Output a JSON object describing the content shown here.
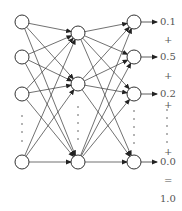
{
  "diagram": {
    "type": "neural-network",
    "layers": [
      {
        "name": "input",
        "x": 22,
        "nodes_y": [
          22,
          57,
          94,
          162
        ],
        "ellipsis_y": [
          116,
          124,
          132,
          141
        ]
      },
      {
        "name": "hidden",
        "x": 78,
        "nodes_y": [
          33,
          84,
          162
        ],
        "ellipsis_y": [
          107,
          115,
          123,
          131,
          139
        ]
      },
      {
        "name": "output",
        "x": 134,
        "nodes_y": [
          22,
          57,
          94,
          162
        ],
        "ellipsis_y": [
          111,
          119,
          127,
          135,
          143
        ]
      }
    ],
    "node_radius": 7,
    "outputs": {
      "values": [
        "0.1",
        "0.5",
        "0.2",
        "0.0"
      ],
      "plus_signs": [
        "+",
        "+",
        "+",
        "+"
      ],
      "equals": "=",
      "sum": "1.0"
    }
  }
}
